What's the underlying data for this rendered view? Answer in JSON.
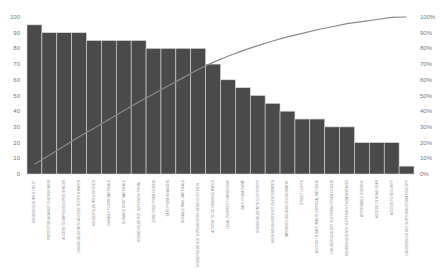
{
  "chart_data": {
    "type": "bar",
    "subtype": "pareto",
    "title": "",
    "xlabel": "",
    "ylabel": "",
    "ylim": [
      0,
      100
    ],
    "y2lim": [
      0,
      100
    ],
    "grid": false,
    "legend": "none",
    "bar_color": "#4a4a4a",
    "line_color": "#8a8a8a",
    "yticks": [
      "0",
      "10",
      "20",
      "30",
      "40",
      "50",
      "60",
      "70",
      "80",
      "90",
      "100"
    ],
    "y2ticks": [
      "0%",
      "10%",
      "20%",
      "30%",
      "40%",
      "50%",
      "60%",
      "70%",
      "80%",
      "90%",
      "100%"
    ],
    "categories": [
      "HOUSEHOLDS WITH TOILET",
      "PROTECTION AGAINST CHICKUN WIND",
      "ACCESS TO IMPROVED OPEN SPACES",
      "HOUSEHOLDS WITH ACCESS TO PIPED WATER",
      "HOUSEHOLDS WITH KITCHEN",
      "DURABLE FLOOR MATERIALS",
      "DURABLE ROOF MATERIALS",
      "HOUSEHOLDS NOT SUFFERING FROM...",
      "ZONE FREE FROM FLOODS",
      "SAFE FROM INVASIONS",
      "DURABLE WALL MATERIALS",
      "HOUSEHOLDS NOT EXPERIENCING BEING EVICTED IN...",
      "ACCESS TO OIL DRINKING WATER",
      "LEGAL PROPERTY OWNERSHIP",
      "SAFE FROM CRIME",
      "HOUSEHOLDS WITH ELECTRICITY",
      "NEIGHBOURHOOD NOT OVERCROWDED",
      "IMPROVED HOUSING ENVIRONMENT",
      "STREET LIGHTS",
      "ACCESS TO SAFE WASTE DISPOSAL METHODS",
      "HOUSEHOLDS NOT SUFFERING FROM FLOODS",
      "HOUSEHOLDS NOT SUFFERING FROM DISEASES",
      "AFFORDABLE HOUSING",
      "ACCESS TO ROAD NEAR",
      "ACCESS TO SECURITY",
      "HOUSEHOLDS NOT SUFFERING FROM POVERTY"
    ],
    "series": [
      {
        "name": "Value",
        "type": "bar",
        "axis": "left",
        "values": [
          95,
          90,
          90,
          90,
          85,
          85,
          85,
          85,
          80,
          80,
          80,
          80,
          70,
          60,
          55,
          50,
          45,
          40,
          35,
          35,
          30,
          30,
          20,
          20,
          20,
          5
        ]
      },
      {
        "name": "Cumulative %",
        "type": "line",
        "axis": "right",
        "values": [
          6.2,
          12.0,
          17.9,
          23.7,
          29.2,
          34.7,
          40.3,
          45.8,
          51.0,
          56.2,
          61.4,
          66.6,
          71.1,
          75.0,
          78.6,
          81.8,
          84.7,
          87.3,
          89.6,
          91.9,
          93.8,
          95.8,
          97.1,
          98.4,
          99.7,
          100.0
        ]
      }
    ]
  }
}
